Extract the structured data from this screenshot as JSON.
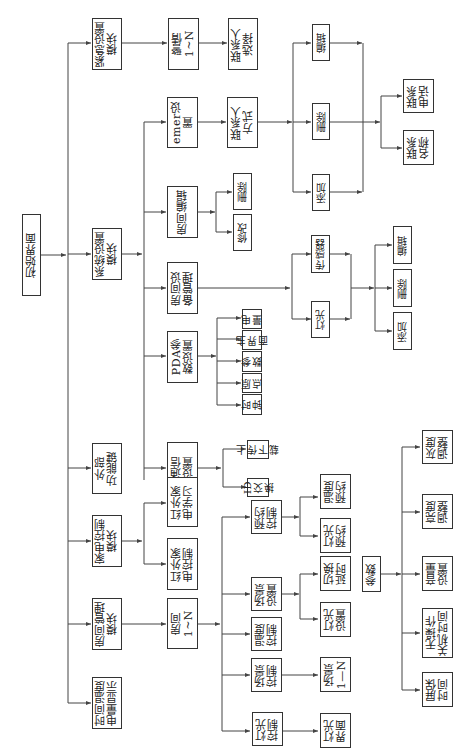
{
  "nodes": {
    "root": "初始界面",
    "emergency": "紧急设置\n模块",
    "system": "系统设置\n模块",
    "external": "外部\n功能键",
    "appliance": "家电控制\n模块",
    "room_mgmt": "房间管理\n模块",
    "time_temp": "时间温度\n电量显示",
    "alarm": "警情\n1~N",
    "contact_select": "联系人\n选择",
    "emer_set": "emer设置",
    "contact_method": "联系人\n方式",
    "add1": "添加",
    "del1": "删除",
    "edit1": "编辑",
    "contact_phone": "联系\n电话",
    "contact_name": "联系\n名称",
    "room_edit": "房间编辑",
    "room_del": "删除",
    "room_modify": "修改",
    "room_device": "房间设\n备管理",
    "sensor": "传感器",
    "light": "灯光",
    "add2": "添加",
    "del2": "删除",
    "edit2": "编辑",
    "pda": "PDA参\n数设置",
    "power": "电\n量",
    "main_ui": "主\n界\n面",
    "params_pda": "参\n数",
    "origin": "原\n点",
    "clock": "时\n钟",
    "comm": "通信\n设置",
    "upload": "上\n传\n下\n载",
    "id_swap": "ID\n交\n换",
    "ir_learn": "红外家\n电学习",
    "ir_ctrl": "红外家\n电控制",
    "room_n": "房间\n1~N",
    "schedule": "预约\n控制",
    "temp_sched": "温度\n预约",
    "light_sched": "灯光\n预约",
    "scene_set": "场景\n设置",
    "switch_delay": "切换\n延时",
    "light_set": "灯光\n设置",
    "temp_ctrl": "温度\n控制",
    "scene_ctrl": "场景\n控制",
    "scene_n": "场景\n1—N",
    "light_ctrl": "灯光\n控制",
    "light_ui": "灯光\n界面",
    "params": "参数",
    "gray_adj": "灰度\n调整",
    "bright_adj": "亮度\n调整",
    "volume_set": "音量\n设置",
    "idle_off": "无操作\n关机时间",
    "screen_saver": "屏保\n时间"
  },
  "colors": {
    "line": "#444444",
    "border": "#333333",
    "text": "#222222"
  }
}
